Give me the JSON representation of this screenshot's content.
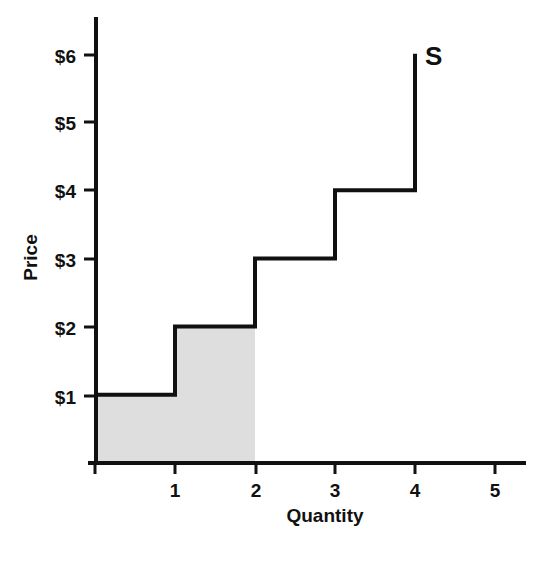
{
  "chart_data": {
    "type": "line",
    "subtype": "step-function",
    "title": "",
    "xlabel": "Quantity",
    "ylabel": "Price",
    "xlim": [
      0,
      5.4
    ],
    "ylim": [
      0,
      6.55
    ],
    "grid": false,
    "legend": "none",
    "x_tick_labels": [
      "1",
      "2",
      "3",
      "4",
      "5"
    ],
    "x_tick_values": [
      1,
      2,
      3,
      4,
      5
    ],
    "y_tick_labels": [
      "$1",
      "$2",
      "$3",
      "$4",
      "$5",
      "$6"
    ],
    "y_tick_values": [
      1,
      2,
      3,
      4,
      5,
      6
    ],
    "series": [
      {
        "name": "S",
        "label": "S",
        "label_position": {
          "x": 4.15,
          "y": 5.85
        },
        "color": "#111111",
        "step_segments": [
          {
            "x_start": 0,
            "x_end": 1,
            "price": 1
          },
          {
            "x_start": 1,
            "x_end": 2,
            "price": 2
          },
          {
            "x_start": 2,
            "x_end": 3,
            "price": 3
          },
          {
            "x_start": 3,
            "x_end": 4,
            "price": 4
          }
        ],
        "terminal_vertical": {
          "x": 4,
          "y_start": 4,
          "y_end": 6
        }
      }
    ],
    "shaded_region": {
      "name": "producer-cost-area",
      "fill": "#dedede",
      "x_start": 0,
      "x_end": 2,
      "bounded_by": "supply-step-curve",
      "heights": [
        {
          "x_start": 0,
          "x_end": 1,
          "top": 1
        },
        {
          "x_start": 1,
          "x_end": 2,
          "top": 2
        }
      ]
    },
    "annotations": []
  },
  "axes": {
    "y_title": "Price",
    "x_title": "Quantity",
    "y_ticks": [
      "$1",
      "$2",
      "$3",
      "$4",
      "$5",
      "$6"
    ],
    "x_ticks": [
      "1",
      "2",
      "3",
      "4",
      "5"
    ]
  },
  "series_label": {
    "supply": "S"
  },
  "colors": {
    "axis": "#111111",
    "curve": "#111111",
    "shading": "#dedede",
    "background": "#ffffff",
    "text": "#111111"
  }
}
